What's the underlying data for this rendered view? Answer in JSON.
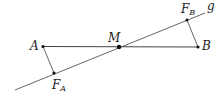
{
  "diagram": {
    "line_label": "g",
    "points": {
      "A": {
        "label": "A"
      },
      "B": {
        "label": "B"
      },
      "M": {
        "label": "M"
      },
      "FA": {
        "label": "F",
        "sub": "A"
      },
      "FB": {
        "label": "F",
        "sub": "B"
      }
    },
    "colors": {
      "stroke": "#333333",
      "point": "#111111"
    }
  }
}
